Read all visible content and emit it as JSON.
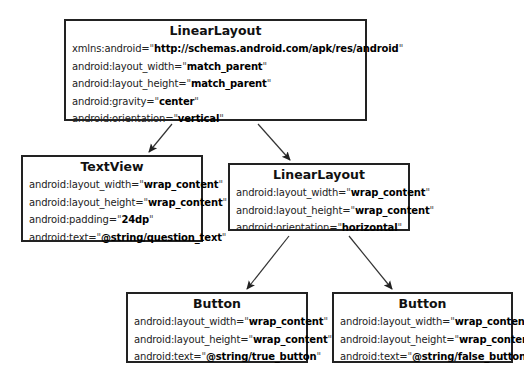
{
  "nodes": {
    "root": {
      "title": "LinearLayout",
      "attrs": [
        {
          "key": "xmlns:android=",
          "value": "http://schemas.android.com/apk/res/android"
        },
        {
          "key": "android:layout_width=",
          "value": "match_parent"
        },
        {
          "key": "android:layout_height=",
          "value": "match_parent"
        },
        {
          "key": "android:gravity=",
          "value": "center"
        },
        {
          "key": "android:orientation=",
          "value": "vertical"
        }
      ]
    },
    "textview": {
      "title": "TextView",
      "attrs": [
        {
          "key": "android:layout_width=",
          "value": "wrap_content"
        },
        {
          "key": "android:layout_height=",
          "value": "wrap_content"
        },
        {
          "key": "android:padding=",
          "value": "24dp"
        },
        {
          "key": "android:text=",
          "value": "@string/question_text"
        }
      ]
    },
    "inner_layout": {
      "title": "LinearLayout",
      "attrs": [
        {
          "key": "android:layout_width=",
          "value": "wrap_content"
        },
        {
          "key": "android:layout_height=",
          "value": "wrap_content"
        },
        {
          "key": "android:orientation=",
          "value": "horizontal"
        }
      ]
    },
    "true_button": {
      "title": "Button",
      "attrs": [
        {
          "key": "android:layout_width=",
          "value": "wrap_content"
        },
        {
          "key": "android:layout_height=",
          "value": "wrap_content"
        },
        {
          "key": "android:text=",
          "value": "@string/true_button"
        }
      ]
    },
    "false_button": {
      "title": "Button",
      "attrs": [
        {
          "key": "android:layout_width=",
          "value": "wrap_content"
        },
        {
          "key": "android:layout_height=",
          "value": "wrap_content"
        },
        {
          "key": "android:text=",
          "value": "@string/false_button"
        }
      ]
    }
  },
  "quote": "\"",
  "edges": [
    {
      "from": "root",
      "to": "textview"
    },
    {
      "from": "root",
      "to": "inner_layout"
    },
    {
      "from": "inner_layout",
      "to": "true_button"
    },
    {
      "from": "inner_layout",
      "to": "false_button"
    }
  ],
  "colors": {
    "border": "#222222",
    "arrow": "#333333",
    "background": "#ffffff"
  }
}
